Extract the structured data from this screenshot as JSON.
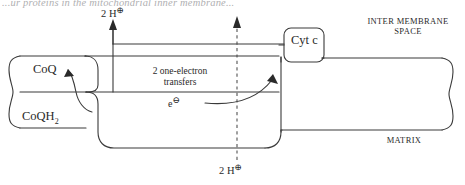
{
  "figure": {
    "title_cut_off": "...ur proteins in the mitochondrial inner membrane...",
    "domain_kind": "biochemistry-membrane-diagram",
    "background_color": "#ffffff",
    "line_color": "#3a3a3a",
    "labels": {
      "proton_top": "2 H",
      "proton_top_charge": "⊕",
      "proton_bottom": "2 H",
      "proton_bottom_charge": "⊕",
      "coq": "CoQ",
      "coqh2_base": "CoQH",
      "coqh2_sub": "2",
      "transfers_line1": "2 one-electron",
      "transfers_line2": "transfers",
      "electron": "e",
      "electron_charge": "⊖",
      "cyt_c": "Cyt c",
      "inter_membrane_space_line1": "INTER MEMBRANE",
      "inter_membrane_space_line2": "SPACE",
      "matrix": "MATRIX"
    }
  }
}
